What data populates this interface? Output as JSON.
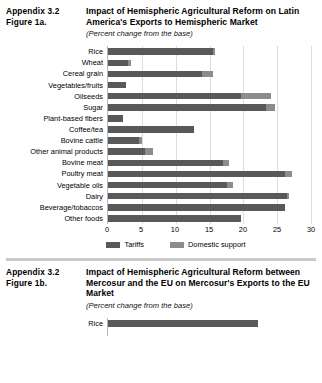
{
  "figure_a": {
    "appendix": "Appendix 3.2",
    "figure_number": "Figure 1a.",
    "title": "Impact of Hemispheric Agricultural Reform on Latin America's Exports to Hemispheric Market",
    "subtitle": "(Percent change from the base)",
    "legend": [
      {
        "label": "Tariffs",
        "color": "#595959"
      },
      {
        "label": "Domestic support",
        "color": "#8c8c8c"
      }
    ],
    "chart_data": {
      "type": "bar",
      "orientation": "horizontal",
      "stacked": true,
      "title": "Impact of Hemispheric Agricultural Reform on Latin America's Exports to Hemispheric Market",
      "xlabel": "",
      "ylabel": "",
      "xlim": [
        0,
        30
      ],
      "xticks": [
        0,
        5,
        10,
        15,
        20,
        25,
        30
      ],
      "grid": true,
      "legend_position": "bottom",
      "categories": [
        "Rice",
        "Wheat",
        "Cereal grain",
        "Vegetables/fruits",
        "Oilseeds",
        "Sugar",
        "Plant-based fibers",
        "Coffee/tea",
        "Bovine cattle",
        "Other animal products",
        "Bovine meat",
        "Poultry meat",
        "Vegetable oils",
        "Dairy",
        "Beverage/tobaccos",
        "Other foods"
      ],
      "series": [
        {
          "name": "Tariffs",
          "color": "#595959",
          "values": [
            15.4,
            3.0,
            13.8,
            2.6,
            19.6,
            23.3,
            2.2,
            12.6,
            4.6,
            5.4,
            16.9,
            26.0,
            17.5,
            26.3,
            26.1,
            19.5
          ]
        },
        {
          "name": "Domestic support",
          "color": "#8c8c8c",
          "values": [
            0.4,
            0.4,
            1.7,
            0.0,
            4.4,
            1.3,
            0.0,
            0.0,
            0.4,
            1.2,
            0.9,
            1.0,
            0.9,
            0.3,
            0.0,
            0.0
          ]
        }
      ],
      "totals": [
        15.8,
        3.4,
        15.5,
        2.6,
        24.0,
        24.6,
        2.2,
        12.6,
        5.0,
        6.6,
        17.8,
        27.0,
        18.4,
        26.6,
        26.1,
        19.5
      ]
    }
  },
  "figure_b": {
    "appendix": "Appendix 3.2",
    "figure_number": "Figure 1b.",
    "title": "Impact of Hemispheric Agricultural Reform between Mercosur and the EU on Mercosur's Exports to the EU Market",
    "subtitle": "(Percent change from the base)",
    "chart_data": {
      "type": "bar",
      "orientation": "horizontal",
      "stacked": true,
      "title": "Impact of Hemispheric Agricultural Reform between Mercosur and the EU on Mercosur's Exports to the EU Market",
      "xlabel": "",
      "ylabel": "",
      "xlim": [
        0,
        30
      ],
      "grid": true,
      "categories": [
        "Rice"
      ],
      "series": [
        {
          "name": "Tariffs",
          "color": "#595959",
          "values": [
            22.0
          ]
        }
      ],
      "totals": [
        22.0
      ]
    }
  }
}
